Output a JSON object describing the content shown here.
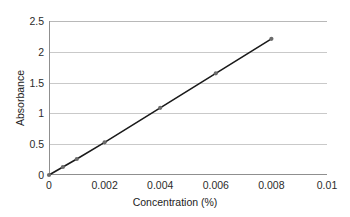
{
  "chart_data": {
    "type": "line",
    "title": "",
    "xlabel": "Concentration (%)",
    "ylabel": "Absorbance",
    "xlim": [
      0,
      0.01
    ],
    "ylim": [
      0,
      2.5
    ],
    "grid": true,
    "legend": "none",
    "marker": "filled-circle",
    "line_color": "#1a1a1a",
    "marker_color": "#6b6b6b",
    "grid_color": "#c9c9c9",
    "axis_color": "#8f8f8f",
    "xticks": [
      "0",
      "0.002",
      "0.004",
      "0.006",
      "0.008",
      "0.01"
    ],
    "xtick_values": [
      0,
      0.002,
      0.004,
      0.006,
      0.008,
      0.01
    ],
    "yticks": [
      "0",
      "0.5",
      "1",
      "1.5",
      "2",
      "2.5"
    ],
    "ytick_values": [
      0,
      0.5,
      1,
      1.5,
      2,
      2.5
    ],
    "series": [
      {
        "name": "Calibration curve",
        "x": [
          0,
          0.0005,
          0.001,
          0.002,
          0.004,
          0.006,
          0.008
        ],
        "y": [
          0.0,
          0.13,
          0.26,
          0.53,
          1.09,
          1.65,
          2.21
        ]
      }
    ]
  }
}
